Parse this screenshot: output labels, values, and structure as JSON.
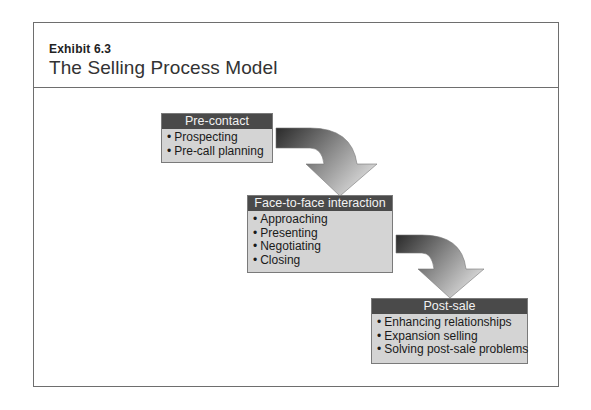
{
  "header": {
    "exhibit_label": "Exhibit 6.3",
    "title": "The Selling Process Model"
  },
  "stages": [
    {
      "title": "Pre-contact",
      "items": [
        "Prospecting",
        "Pre-call planning"
      ]
    },
    {
      "title": "Face-to-face interaction",
      "items": [
        "Approaching",
        "Presenting",
        "Negotiating",
        "Closing"
      ]
    },
    {
      "title": "Post-sale",
      "items": [
        "Enhancing relationships",
        "Expansion selling",
        "Solving post-sale problems"
      ]
    }
  ],
  "colors": {
    "header_bar": "#4a4a4a",
    "box_body": "#d4d4d4",
    "arrow_dark": "#2e2e2e",
    "arrow_light": "#c8c8c8",
    "frame_border": "#6e6e6e"
  }
}
